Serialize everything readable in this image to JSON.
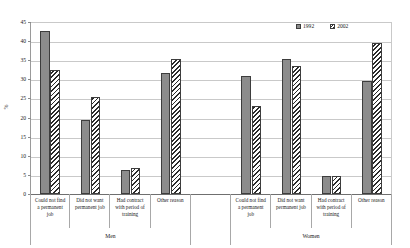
{
  "chart_data": {
    "type": "bar",
    "title": "",
    "xlabel": "",
    "ylabel": "%",
    "ylim": [
      0,
      45
    ],
    "yticks": [
      0,
      5,
      10,
      15,
      20,
      25,
      30,
      35,
      40,
      45
    ],
    "grid": true,
    "legend_position": "top-right",
    "legend": [
      "1992",
      "2002"
    ],
    "groups": [
      "Men",
      "Women"
    ],
    "categories": [
      "Could not find a permanent job",
      "Did not want permanent job",
      "Had contract with period of training",
      "Other reason"
    ],
    "category_lines": [
      [
        "Could not find",
        "a permanent",
        "job"
      ],
      [
        "Did not want",
        "permanent job"
      ],
      [
        "Had contract",
        "with period of",
        "training"
      ],
      [
        "Other reason"
      ]
    ],
    "series": [
      {
        "name": "1992",
        "color": "#8c8c8c",
        "values_men": [
          42.7,
          19.3,
          6.3,
          31.7
        ],
        "values_women": [
          31.0,
          35.2,
          4.8,
          29.5
        ]
      },
      {
        "name": "2002",
        "color": "#ffffff",
        "pattern": "diagonal-hatch",
        "values_men": [
          32.4,
          25.3,
          6.8,
          35.2
        ],
        "values_women": [
          22.9,
          33.4,
          4.8,
          39.5
        ]
      }
    ]
  },
  "axis": {
    "y_label": "%",
    "tick_labels": [
      "45",
      "40",
      "35",
      "30",
      "25",
      "20",
      "15",
      "10",
      "5",
      "0"
    ]
  },
  "colors": {
    "series_1992": "#8c8c8c",
    "series_2002": "#ffffff",
    "bar_outline": "#3d3d3d",
    "gridline": "#c9c9c9",
    "axis": "#6f6f6f",
    "text": "#1a1a1a"
  }
}
